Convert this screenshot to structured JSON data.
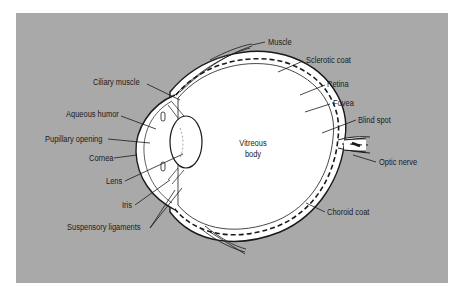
{
  "diagram": {
    "title": "",
    "colors": {
      "background": "#a9a9a9",
      "eye_fill": "#ffffff",
      "outline": "#1a1a1a",
      "page": "#ffffff"
    },
    "center_label": {
      "line1": "Vitreous",
      "line2": "body"
    },
    "labels_left": [
      {
        "id": "ciliary-muscle",
        "text": "Ciliary muscle"
      },
      {
        "id": "aqueous-humor",
        "text": "Aqueous humor"
      },
      {
        "id": "pupillary-opening",
        "text": "Pupillary opening"
      },
      {
        "id": "cornea",
        "text": "Cornea"
      },
      {
        "id": "lens",
        "text": "Lens"
      },
      {
        "id": "iris",
        "text": "Iris"
      },
      {
        "id": "suspensory-ligaments",
        "text": "Suspensory ligaments"
      }
    ],
    "labels_right": [
      {
        "id": "muscle",
        "text": "Muscle"
      },
      {
        "id": "sclerotic-coat",
        "text": "Sclerotic coat"
      },
      {
        "id": "retina",
        "text": "Retina"
      },
      {
        "id": "fovea",
        "text": "Fovea"
      },
      {
        "id": "blind-spot",
        "text": "Blind spot"
      },
      {
        "id": "optic-nerve",
        "text": "Optic nerve"
      },
      {
        "id": "choroid-coat",
        "text": "Choroid coat"
      }
    ]
  }
}
